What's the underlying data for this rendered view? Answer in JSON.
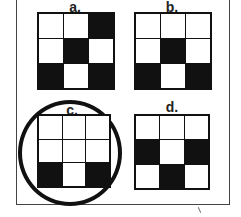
{
  "options": [
    {
      "label": "a.",
      "cells": [
        [
          0,
          0,
          1
        ],
        [
          0,
          1,
          0
        ],
        [
          1,
          0,
          1
        ]
      ],
      "circled": false
    },
    {
      "label": "b.",
      "cells": [
        [
          0,
          0,
          0
        ],
        [
          0,
          1,
          0
        ],
        [
          1,
          0,
          1
        ]
      ],
      "circled": false
    },
    {
      "label": "c.",
      "cells": [
        [
          0,
          0,
          0
        ],
        [
          0,
          0,
          0
        ],
        [
          1,
          0,
          1
        ]
      ],
      "circled": true
    },
    {
      "label": "d.",
      "cells": [
        [
          0,
          0,
          0
        ],
        [
          1,
          0,
          1
        ],
        [
          0,
          1,
          0
        ]
      ],
      "circled": false
    }
  ],
  "colors": {
    "filled": "#111111",
    "empty": "#ffffff",
    "border": "#111111"
  }
}
